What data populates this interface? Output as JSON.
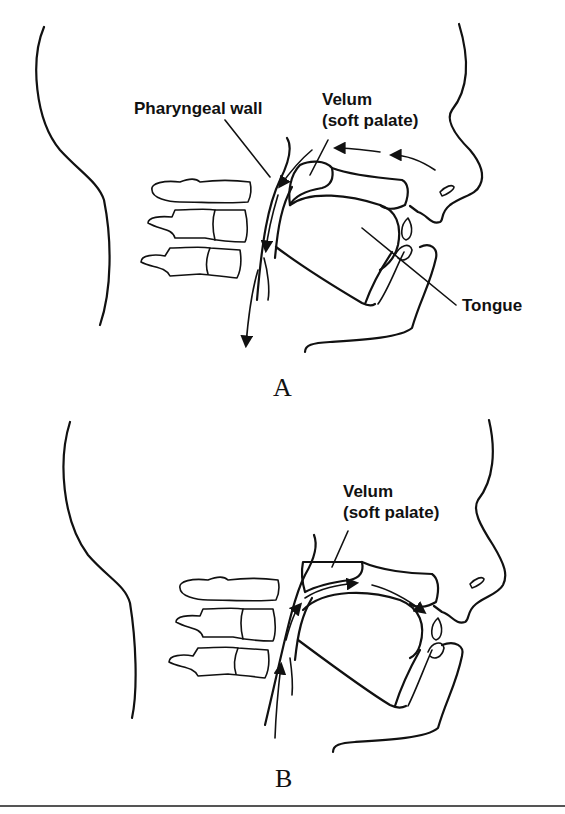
{
  "figure": {
    "panels": [
      {
        "id": "A",
        "caption": "A",
        "labels": {
          "pharyngeal_wall": "Pharyngeal wall",
          "velum_line1": "Velum",
          "velum_line2": "(soft palate)",
          "tongue": "Tongue"
        },
        "airflow": "nasal-to-pharynx (downward)"
      },
      {
        "id": "B",
        "caption": "B",
        "labels": {
          "velum_line1": "Velum",
          "velum_line2": "(soft palate)"
        },
        "airflow": "pharynx-to-oral (upward)"
      }
    ],
    "colors": {
      "line": "#111111",
      "background": "#ffffff",
      "rule": "#555555"
    }
  }
}
